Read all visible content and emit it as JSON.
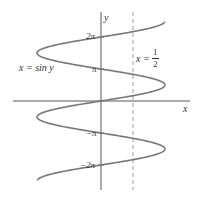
{
  "figure": {
    "curve_label": "x = sin y",
    "line_label_prefix": "x =",
    "line_label_num": "1",
    "line_label_den": "2",
    "x_axis_label": "x",
    "y_axis_label": "y",
    "y_ticks": [
      {
        "label": "2π",
        "value": 6.2832
      },
      {
        "label": "π",
        "value": 3.1416
      },
      {
        "label": "−π",
        "value": -3.1416
      },
      {
        "label": "−2π",
        "value": -6.2832
      }
    ],
    "colors": {
      "curve": "#777777",
      "axes": "#444444",
      "dashed": "#888888",
      "text": "#333333"
    }
  },
  "chart_data": {
    "type": "line",
    "title": "",
    "xlabel": "x",
    "ylabel": "y",
    "series": [
      {
        "name": "x = sin y",
        "style": "solid",
        "relation": "x = sin(y)",
        "y_range": [
          -7.8,
          7.8
        ]
      },
      {
        "name": "x = 1/2",
        "style": "dashed",
        "relation": "x = 0.5"
      }
    ],
    "y_ticks": [
      "2π",
      "π",
      "−π",
      "−2π"
    ],
    "xlim": [
      -1.1,
      1.1
    ],
    "ylim": [
      -8,
      8
    ],
    "grid": false,
    "legend": "none"
  }
}
